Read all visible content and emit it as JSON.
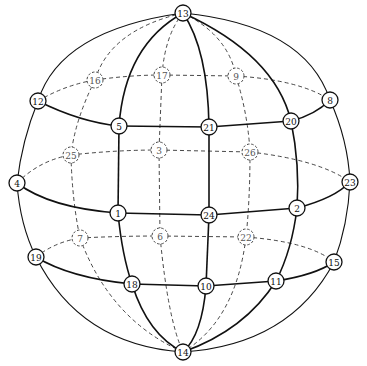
{
  "diagram": {
    "type": "sphere-graph",
    "nodes": [
      {
        "id": "13",
        "x": 183,
        "y": 13,
        "visible": true
      },
      {
        "id": "14",
        "x": 183,
        "y": 352,
        "visible": true
      },
      {
        "id": "12",
        "x": 38,
        "y": 101,
        "visible": true
      },
      {
        "id": "8",
        "x": 330,
        "y": 100,
        "visible": true
      },
      {
        "id": "16",
        "x": 95,
        "y": 80,
        "visible": false
      },
      {
        "id": "17",
        "x": 162,
        "y": 75,
        "visible": false
      },
      {
        "id": "9",
        "x": 236,
        "y": 76,
        "visible": false
      },
      {
        "id": "5",
        "x": 119,
        "y": 126,
        "visible": true
      },
      {
        "id": "21",
        "x": 209,
        "y": 127,
        "visible": true
      },
      {
        "id": "20",
        "x": 291,
        "y": 121,
        "visible": true
      },
      {
        "id": "25",
        "x": 71,
        "y": 155,
        "visible": false
      },
      {
        "id": "3",
        "x": 159,
        "y": 150,
        "visible": false
      },
      {
        "id": "26",
        "x": 250,
        "y": 152,
        "visible": false
      },
      {
        "id": "4",
        "x": 17,
        "y": 183,
        "visible": true
      },
      {
        "id": "23",
        "x": 350,
        "y": 182,
        "visible": true
      },
      {
        "id": "1",
        "x": 118,
        "y": 213,
        "visible": true
      },
      {
        "id": "24",
        "x": 209,
        "y": 215,
        "visible": true
      },
      {
        "id": "2",
        "x": 297,
        "y": 208,
        "visible": true
      },
      {
        "id": "7",
        "x": 80,
        "y": 238,
        "visible": false
      },
      {
        "id": "6",
        "x": 160,
        "y": 236,
        "visible": false
      },
      {
        "id": "22",
        "x": 246,
        "y": 237,
        "visible": false
      },
      {
        "id": "19",
        "x": 36,
        "y": 257,
        "visible": true
      },
      {
        "id": "15",
        "x": 334,
        "y": 262,
        "visible": true
      },
      {
        "id": "18",
        "x": 132,
        "y": 284,
        "visible": true
      },
      {
        "id": "10",
        "x": 206,
        "y": 286,
        "visible": true
      },
      {
        "id": "11",
        "x": 276,
        "y": 281,
        "visible": true
      }
    ],
    "solid_edges": [
      {
        "d": "M183,13 Q60,30 38,101"
      },
      {
        "d": "M38,101 Q22,140 17,183"
      },
      {
        "d": "M17,183 Q20,225 36,257"
      },
      {
        "d": "M36,257 Q80,345 183,352"
      },
      {
        "d": "M183,13 Q305,25 330,100"
      },
      {
        "d": "M330,100 Q348,140 350,182"
      },
      {
        "d": "M350,182 Q348,225 334,262"
      },
      {
        "d": "M334,262 Q290,345 183,352"
      },
      {
        "d": "M183,13 Q125,45 119,126"
      },
      {
        "d": "M119,126 L118,213"
      },
      {
        "d": "M118,213 Q122,255 132,284"
      },
      {
        "d": "M132,284 Q148,335 183,352"
      },
      {
        "d": "M183,13 Q208,50 209,127"
      },
      {
        "d": "M209,127 L209,215"
      },
      {
        "d": "M209,215 L206,286"
      },
      {
        "d": "M206,286 Q202,335 183,352"
      },
      {
        "d": "M183,13 Q275,55 291,121"
      },
      {
        "d": "M291,121 Q300,165 297,208"
      },
      {
        "d": "M297,208 Q292,250 276,281"
      },
      {
        "d": "M276,281 Q245,330 183,352"
      },
      {
        "d": "M38,101 Q80,122 119,126"
      },
      {
        "d": "M119,126 L209,127"
      },
      {
        "d": "M209,127 L291,121"
      },
      {
        "d": "M291,121 Q315,115 330,100"
      },
      {
        "d": "M17,183 Q50,208 118,213"
      },
      {
        "d": "M118,213 L209,215"
      },
      {
        "d": "M209,215 L297,208"
      },
      {
        "d": "M297,208 Q335,198 350,182"
      },
      {
        "d": "M36,257 Q70,278 132,284"
      },
      {
        "d": "M132,284 L206,286"
      },
      {
        "d": "M206,286 L276,281"
      },
      {
        "d": "M276,281 Q315,275 334,262"
      }
    ],
    "dashed_edges": [
      {
        "d": "M183,13 Q110,30 95,80"
      },
      {
        "d": "M95,80 Q75,120 71,155"
      },
      {
        "d": "M71,155 Q72,200 80,238"
      },
      {
        "d": "M80,238 Q110,320 183,352"
      },
      {
        "d": "M183,13 Q165,35 162,75"
      },
      {
        "d": "M162,75 L159,150"
      },
      {
        "d": "M159,150 L160,236"
      },
      {
        "d": "M160,236 Q168,320 183,352"
      },
      {
        "d": "M183,13 Q228,35 236,76"
      },
      {
        "d": "M236,76 Q248,115 250,152"
      },
      {
        "d": "M250,152 Q250,200 246,237"
      },
      {
        "d": "M246,237 Q236,320 183,352"
      },
      {
        "d": "M38,101 Q65,85 95,80"
      },
      {
        "d": "M95,80 Q130,75 162,75"
      },
      {
        "d": "M162,75 L236,76"
      },
      {
        "d": "M236,76 Q300,80 330,100"
      },
      {
        "d": "M17,183 Q40,160 71,155"
      },
      {
        "d": "M71,155 Q115,150 159,150"
      },
      {
        "d": "M159,150 L250,152"
      },
      {
        "d": "M250,152 Q320,160 350,182"
      },
      {
        "d": "M36,257 Q55,242 80,238"
      },
      {
        "d": "M80,238 Q120,236 160,236"
      },
      {
        "d": "M160,236 L246,237"
      },
      {
        "d": "M246,237 Q310,242 334,262"
      }
    ]
  }
}
